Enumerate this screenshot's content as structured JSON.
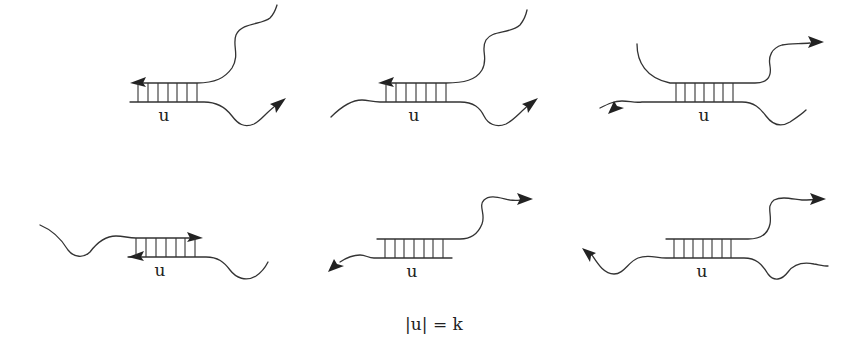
{
  "figure": {
    "caption": "|u| = k",
    "stroke_color": "#333333",
    "background": "#ffffff"
  },
  "panels": [
    {
      "id": 1,
      "row": 1,
      "col": 1,
      "label": "u",
      "rungs": 7,
      "description": "Duplex region u; top strand ends with left-pointing arrow inside duplex, continues right as tail going up; bottom strand continues right as tail ending in arrow."
    },
    {
      "id": 2,
      "row": 1,
      "col": 2,
      "label": "u",
      "rungs": 7,
      "description": "Duplex region u; top strand arrow pointing left at duplex start; bottom strand extends left as tail and right as tail ending in arrow."
    },
    {
      "id": 3,
      "row": 1,
      "col": 3,
      "label": "u",
      "rungs": 7,
      "description": "Duplex region u fully internal; top strand has left tail curving up and right tail ending in arrow; bottom strand has left tail with arrow and right tail."
    },
    {
      "id": 4,
      "row": 2,
      "col": 1,
      "label": "u",
      "rungs": 7,
      "description": "Duplex region u with both strands ending inside duplex in opposite arrows; top tail extends left, bottom tail extends right."
    },
    {
      "id": 5,
      "row": 2,
      "col": 2,
      "label": "u",
      "rungs": 7,
      "description": "Duplex region u; top strand continues right as tail ending in arrow; bottom strand continues left as tail ending in arrow."
    },
    {
      "id": 6,
      "row": 2,
      "col": 3,
      "label": "u",
      "rungs": 7,
      "description": "Duplex region u; top strand right tail ends in arrow; bottom strand has left tail ending in arrow and right tail."
    }
  ]
}
